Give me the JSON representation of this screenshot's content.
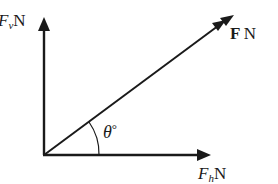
{
  "diagram": {
    "type": "force-vector-resolution",
    "vectors": [
      {
        "name": "vertical",
        "symbol": "F",
        "subscript": "v",
        "unit": "N"
      },
      {
        "name": "horizontal",
        "symbol": "F",
        "subscript": "h",
        "unit": "N"
      },
      {
        "name": "resultant",
        "symbol": "F",
        "unit": "N"
      }
    ],
    "angle": {
      "symbol": "θ",
      "unit": "°"
    },
    "colors": {
      "line": "#1a1a1a",
      "background": "#ffffff"
    }
  }
}
